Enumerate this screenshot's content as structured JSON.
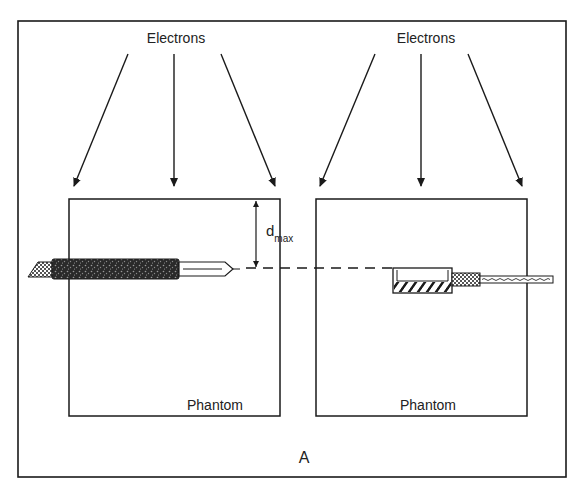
{
  "figure": {
    "panel_label": "A",
    "left_panel": {
      "source_label": "Electrons",
      "phantom_label": "Phantom",
      "depth_label": "d",
      "depth_subscript": "max",
      "detector": "cylindrical ionization chamber (thimble), parallel to beam surface"
    },
    "right_panel": {
      "source_label": "Electrons",
      "phantom_label": "Phantom",
      "detector": "parallel-plate (plane-parallel) ionization chamber with cable"
    }
  },
  "colors": {
    "line": "#1a1a1a",
    "background": "#ffffff"
  }
}
